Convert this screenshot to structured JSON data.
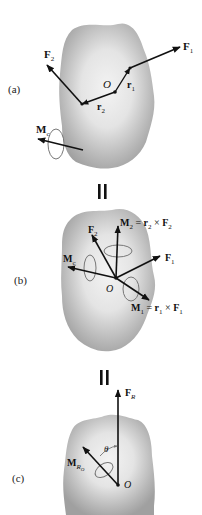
{
  "figure": {
    "panels": [
      {
        "id": "a",
        "label": "(a)",
        "labels": {
          "F1": "F",
          "F1_sub": "1",
          "F2": "F",
          "F2_sub": "2",
          "O": "O",
          "r1": "r",
          "r1_sub": "1",
          "r2": "r",
          "r2_sub": "2",
          "Mc": "M",
          "Mc_sub": "c"
        }
      },
      {
        "id": "b",
        "label": "(b)",
        "labels": {
          "M2": "M",
          "M2_sub": "2",
          "M2_eq": " = ",
          "M2_r": "r",
          "M2_r_sub": "2",
          "M2_x": " × ",
          "M2_F": "F",
          "M2_F_sub": "2",
          "F2": "F",
          "F2_sub": "2",
          "F1": "F",
          "F1_sub": "1",
          "Mc": "M",
          "Mc_sub": "c",
          "O": "O",
          "M1": "M",
          "M1_sub": "1",
          "M1_eq": " = ",
          "M1_r": "r",
          "M1_r_sub": "1",
          "M1_x": " × ",
          "M1_F": "F",
          "M1_F_sub": "1"
        }
      },
      {
        "id": "c",
        "label": "(c)",
        "labels": {
          "FR": "F",
          "FR_sub": "R",
          "theta": "θ",
          "MRO": "M",
          "MRO_sub": "R",
          "MRO_subsub": "O",
          "O": "O"
        }
      }
    ],
    "separators": [
      "equals-sign",
      "equals-sign"
    ],
    "colors": {
      "body_fill_outer": "#a9a9a9",
      "body_fill_inner": "#eeeeee",
      "arrow": "#111111",
      "moment_ring": "#777777"
    }
  }
}
